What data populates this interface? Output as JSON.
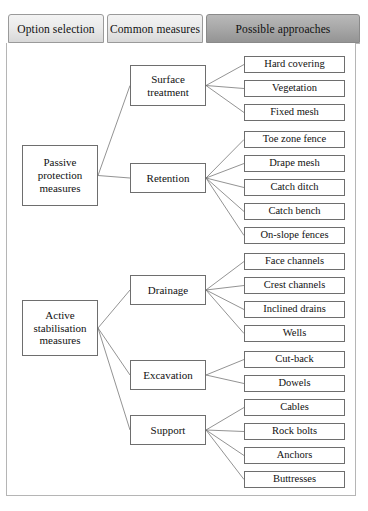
{
  "tabs": [
    {
      "label": "Option selection",
      "selected": false
    },
    {
      "label": "Common measures",
      "selected": false
    },
    {
      "label": "Possible approaches",
      "selected": true
    }
  ],
  "colors": {
    "tab_face": "#ebebeb",
    "tab_selected_face": "#a9a9a9",
    "box_border": "#6e6e6e",
    "panel_border": "#b5b5b5",
    "connector": "#6f6f6f",
    "background": "#ffffff"
  },
  "diagram": {
    "type": "tree",
    "level1": [
      {
        "id": "passive",
        "label": "Passive protection measures",
        "x": 22,
        "y": 145,
        "w": 76,
        "h": 61
      },
      {
        "id": "active",
        "label": "Active stabilisation measures",
        "x": 22,
        "y": 300,
        "w": 76,
        "h": 56
      }
    ],
    "level2": [
      {
        "id": "surface",
        "label": "Surface treatment",
        "parent": "passive",
        "x": 130,
        "y": 65,
        "w": 76,
        "h": 41
      },
      {
        "id": "retention",
        "label": "Retention",
        "parent": "passive",
        "x": 130,
        "y": 163,
        "w": 76,
        "h": 30
      },
      {
        "id": "drainage",
        "label": "Drainage",
        "parent": "active",
        "x": 130,
        "y": 275,
        "w": 76,
        "h": 30
      },
      {
        "id": "excavation",
        "label": "Excavation",
        "parent": "active",
        "x": 130,
        "y": 360,
        "w": 76,
        "h": 30
      },
      {
        "id": "support",
        "label": "Support",
        "parent": "active",
        "x": 130,
        "y": 415,
        "w": 76,
        "h": 30
      }
    ],
    "level3": [
      {
        "label": "Hard covering",
        "parent": "surface",
        "y": 56
      },
      {
        "label": "Vegetation",
        "parent": "surface",
        "y": 80
      },
      {
        "label": "Fixed mesh",
        "parent": "surface",
        "y": 104
      },
      {
        "label": "Toe zone fence",
        "parent": "retention",
        "y": 131
      },
      {
        "label": "Drape mesh",
        "parent": "retention",
        "y": 155
      },
      {
        "label": "Catch ditch",
        "parent": "retention",
        "y": 179
      },
      {
        "label": "Catch bench",
        "parent": "retention",
        "y": 203
      },
      {
        "label": "On-slope fences",
        "parent": "retention",
        "y": 227
      },
      {
        "label": "Face channels",
        "parent": "drainage",
        "y": 253
      },
      {
        "label": "Crest channels",
        "parent": "drainage",
        "y": 277
      },
      {
        "label": "Inclined drains",
        "parent": "drainage",
        "y": 301
      },
      {
        "label": "Wells",
        "parent": "drainage",
        "y": 325
      },
      {
        "label": "Cut-back",
        "parent": "excavation",
        "y": 351
      },
      {
        "label": "Dowels",
        "parent": "excavation",
        "y": 375
      },
      {
        "label": "Cables",
        "parent": "support",
        "y": 399
      },
      {
        "label": "Rock bolts",
        "parent": "support",
        "y": 423
      },
      {
        "label": "Anchors",
        "parent": "support",
        "y": 447
      },
      {
        "label": "Buttresses",
        "parent": "support",
        "y": 471
      }
    ]
  }
}
